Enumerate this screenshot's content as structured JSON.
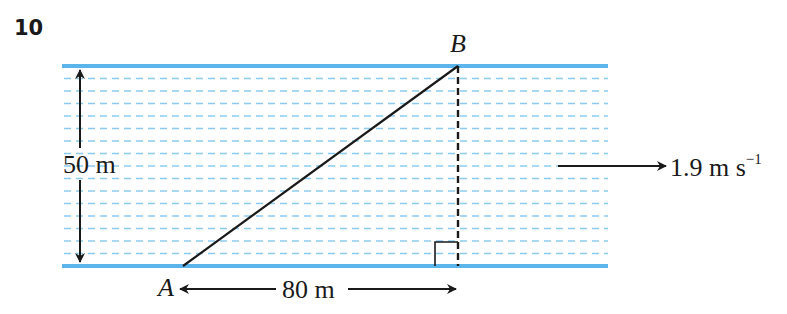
{
  "question": {
    "number": "10"
  },
  "diagram": {
    "point_a": "A",
    "point_b": "B",
    "width_label": "50 m",
    "downstream_label": "80 m",
    "current_label": "1.9 m s",
    "current_exponent": "−1",
    "colors": {
      "river_bank": "#5bb4ea",
      "water_lines": "#8ccbf0",
      "ink": "#1a1a1a"
    }
  }
}
